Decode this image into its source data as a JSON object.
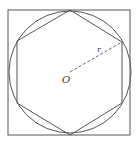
{
  "diagram": {
    "colors": {
      "stroke": "#555555",
      "background": "#ffffff",
      "label": "#333333"
    },
    "square": {
      "x": 8,
      "y": 10,
      "width": 122,
      "height": 125
    },
    "circle": {
      "cx": 70,
      "cy": 72,
      "r": 61
    },
    "hexagon_points": "70,10 122,42 122,103 70,135 17,103 17,41",
    "radius_line": {
      "x1": 70,
      "y1": 72,
      "x2": 122,
      "y2": 42
    },
    "labels": {
      "center": "O",
      "radius": "r"
    }
  }
}
